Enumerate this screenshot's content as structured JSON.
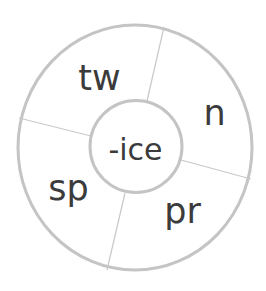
{
  "diagram": {
    "type": "word-wheel",
    "center": {
      "label": "-ice"
    },
    "segments": [
      {
        "label": "tw",
        "position": "top-left"
      },
      {
        "label": "n",
        "position": "right"
      },
      {
        "label": "pr",
        "position": "bottom-right"
      },
      {
        "label": "sp",
        "position": "left"
      }
    ],
    "colors": {
      "stroke": "#c4c4c4",
      "text": "#3b3b3b",
      "background": "#ffffff"
    }
  }
}
